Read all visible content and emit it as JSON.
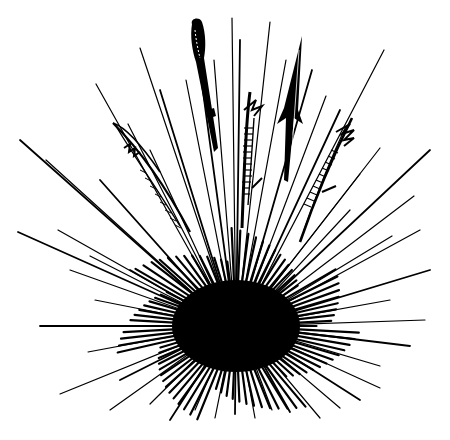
{
  "illustration": {
    "subject": "sea urchin",
    "style": "black ink line drawing on white",
    "colors": {
      "ink": "#000000",
      "background": "#ffffff"
    },
    "body": {
      "cx": 236,
      "cy": 326,
      "rx": 62,
      "ry": 44
    },
    "ornate_spines": [
      {
        "name": "ornate-spine-left",
        "kind": "serrated"
      },
      {
        "name": "ornate-spine-top",
        "kind": "club"
      },
      {
        "name": "ornate-spine-center",
        "kind": "banded-barbed"
      },
      {
        "name": "ornate-spine-arrow",
        "kind": "arrowhead"
      },
      {
        "name": "ornate-spine-right",
        "kind": "banded-barbed"
      }
    ]
  }
}
